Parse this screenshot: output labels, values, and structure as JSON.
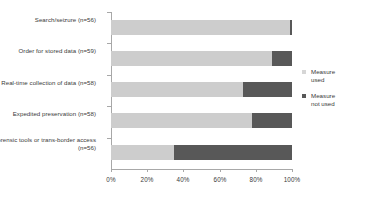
{
  "chart_data": {
    "type": "bar",
    "subtype": "stacked-horizontal-100-percent",
    "title": "",
    "xlabel": "",
    "ylabel": "",
    "categories": [
      "Search/seizure\n(n=56)",
      "Order for stored data\n(n=59)",
      "Real-time collection of data\n(n=58)",
      "Expedited preservation\n(n=58)",
      "Remote forensic tools or\ntrans-border access\n(n=56)"
    ],
    "series": [
      {
        "name": "Measure used",
        "color": "#cdcdcd",
        "values": [
          99,
          89,
          73,
          78,
          35
        ]
      },
      {
        "name": "Measure not used",
        "color": "#585858",
        "values": [
          1,
          11,
          27,
          22,
          65
        ]
      }
    ],
    "xticks": [
      "0%",
      "20%",
      "40%",
      "60%",
      "80%",
      "100%"
    ],
    "xtick_values": [
      0,
      20,
      40,
      60,
      80,
      100
    ],
    "xlim": [
      0,
      100
    ],
    "grid": false,
    "legend_position": "right"
  },
  "legend": {
    "items": [
      {
        "label": "Measure\nused",
        "swatch": "light-gray-swatch"
      },
      {
        "label": "Measure\nnot used",
        "swatch": "dark-gray-swatch"
      }
    ]
  },
  "colors": {
    "measure_used": "#cdcdcd",
    "measure_not_used": "#585858",
    "axis": "#a8a8a8",
    "text": "#3a3a3a",
    "background": "#ffffff"
  }
}
